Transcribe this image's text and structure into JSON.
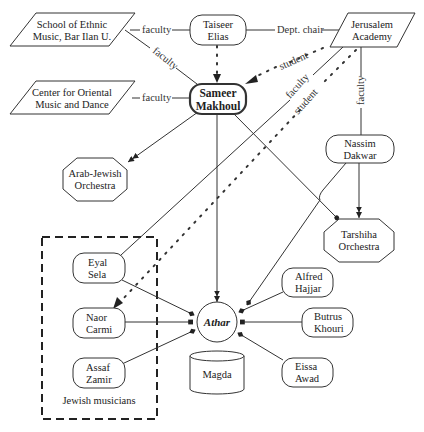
{
  "diagram": {
    "nodes": {
      "school_ethnic": {
        "line1": "School of Ethnic",
        "line2": "Music, Bar Ilan U."
      },
      "center_oriental": {
        "line1": "Center for Oriental",
        "line2": "Music and Dance"
      },
      "taiseer": {
        "line1": "Taiseer",
        "line2": "Elias"
      },
      "jerusalem": {
        "line1": "Jerusalem",
        "line2": "Academy"
      },
      "sameer": {
        "line1": "Sameer",
        "line2": "Makhoul"
      },
      "arab_jewish": {
        "line1": "Arab-Jewish",
        "line2": "Orchestra"
      },
      "nassim": {
        "line1": "Nassim",
        "line2": "Dakwar"
      },
      "tarshiha": {
        "line1": "Tarshiha",
        "line2": "Orchestra"
      },
      "eyal": {
        "line1": "Eyal",
        "line2": "Sela"
      },
      "naor": {
        "line1": "Naor",
        "line2": "Carmi"
      },
      "assaf": {
        "line1": "Assaf",
        "line2": "Zamir"
      },
      "athar": {
        "line1": "Athar"
      },
      "alfred": {
        "line1": "Alfred",
        "line2": "Hajjar"
      },
      "butrus": {
        "line1": "Butrus",
        "line2": "Khouri"
      },
      "eissa": {
        "line1": "Eissa",
        "line2": "Awad"
      },
      "magda": {
        "line1": "Magda"
      }
    },
    "cluster": {
      "label": "Jewish musicians"
    },
    "edge_labels": {
      "school_taiseer": "faculty",
      "school_sameer": "faculty",
      "center_sameer": "faculty",
      "taiseer_jerusalem": "Dept. chair",
      "jerusalem_sameer": "student",
      "jerusalem_eyal": "faculty",
      "jerusalem_naor": "student",
      "jerusalem_nassim": "faculty"
    },
    "colors": {
      "stroke": "#333333",
      "background": "#ffffff"
    }
  }
}
